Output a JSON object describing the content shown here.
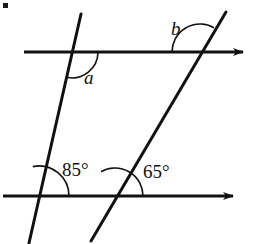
{
  "figure": {
    "background_color": "#ffffff",
    "stroke_color": "#111111",
    "width": 259,
    "height": 244,
    "corner_marker": {
      "name": "bullet-dot",
      "x": 3,
      "y": 3,
      "size": 5,
      "color": "#1a1a1a"
    },
    "lines": [
      {
        "name": "top-parallel-line",
        "kind": "ray-with-arrow",
        "x1": 24,
        "y1": 52,
        "x2": 250,
        "y2": 52,
        "arrow_end": "right",
        "stroke_width": 3
      },
      {
        "name": "bottom-parallel-line",
        "kind": "ray-with-arrow",
        "x1": 3,
        "y1": 196,
        "x2": 240,
        "y2": 196,
        "arrow_end": "right",
        "stroke_width": 3
      },
      {
        "name": "left-transversal",
        "kind": "segment",
        "x1": 81,
        "y1": 14,
        "x2": 29,
        "y2": 243,
        "stroke_width": 3
      },
      {
        "name": "right-transversal",
        "kind": "segment",
        "x1": 226,
        "y1": 12,
        "x2": 91,
        "y2": 241,
        "stroke_width": 3
      }
    ],
    "intersections": [
      {
        "name": "top-left-vertex",
        "x": 72,
        "y": 52
      },
      {
        "name": "top-right-vertex",
        "x": 200,
        "y": 52
      },
      {
        "name": "bottom-left-vertex",
        "x": 39,
        "y": 196
      },
      {
        "name": "bottom-right-vertex",
        "x": 115,
        "y": 196
      }
    ],
    "angle_arcs": [
      {
        "name": "arc-angle-a",
        "vertex": "top-left-vertex",
        "cx": 72,
        "cy": 52,
        "radius": 26,
        "start_deg": 0,
        "end_deg": 102,
        "stroke_width": 1.6
      },
      {
        "name": "arc-angle-b",
        "vertex": "top-right-vertex",
        "cx": 200,
        "cy": 52,
        "radius": 28,
        "start_deg": 180,
        "end_deg": 300,
        "stroke_width": 1.6
      },
      {
        "name": "arc-angle-85",
        "vertex": "bottom-left-vertex",
        "cx": 39,
        "cy": 196,
        "radius": 30,
        "start_deg": 0,
        "end_deg": 102,
        "stroke_width": 1.6
      },
      {
        "name": "arc-angle-65",
        "vertex": "bottom-right-vertex",
        "cx": 115,
        "cy": 196,
        "radius": 28,
        "start_deg": 0,
        "end_deg": 120,
        "stroke_width": 1.6
      }
    ],
    "labels": {
      "angle_a": "a",
      "angle_b": "b",
      "angle_bottom_left": "85°",
      "angle_bottom_right": "65°"
    }
  }
}
